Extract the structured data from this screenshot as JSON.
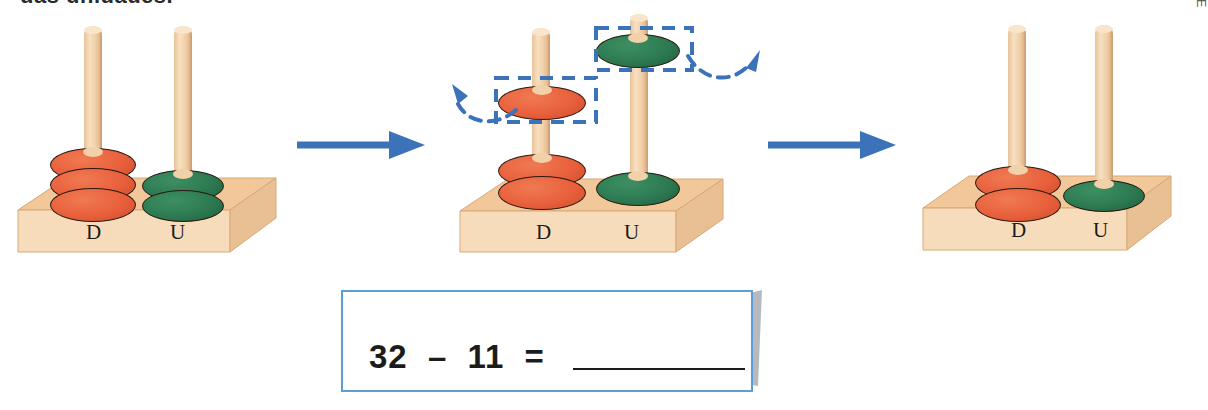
{
  "caption": {
    "cut_text": "das unidades."
  },
  "credit": {
    "text": "ILUSTRAÇÕES: EDITORIA DE ARTE"
  },
  "colors": {
    "disc_red": "#E8603C",
    "disc_green": "#2D7A52",
    "wood_top": "#F2C89A",
    "wood_front": "#F7DCBB",
    "peg": "#F0CFA0",
    "arrow_blue": "#3B72B8",
    "dash_blue": "#3B72B8",
    "box_border": "#5B9ED6",
    "outline": "#2A1A10"
  },
  "panels": [
    {
      "id": "step-1",
      "name": "abacus-start",
      "columns": [
        {
          "label": "D",
          "place": "dezenas",
          "color": "red",
          "count": 3
        },
        {
          "label": "U",
          "place": "unidades",
          "color": "green",
          "count": 2
        }
      ],
      "value": 32,
      "removed_red": 0,
      "removed_green": 0
    },
    {
      "id": "step-2",
      "name": "abacus-removing",
      "columns": [
        {
          "label": "D",
          "place": "dezenas",
          "color": "red",
          "count": 2
        },
        {
          "label": "U",
          "place": "unidades",
          "color": "green",
          "count": 1
        }
      ],
      "value": 21,
      "removed_red": 1,
      "removed_green": 1,
      "highlight_boxes": [
        {
          "name": "selection-box-red-disc",
          "target": "red-disc-lifted"
        },
        {
          "name": "selection-box-green-disc",
          "target": "green-disc-lifted"
        }
      ],
      "curved_arrows": [
        {
          "name": "curved-arrow-remove-red",
          "direction": "up-left"
        },
        {
          "name": "curved-arrow-remove-green",
          "direction": "up-right"
        }
      ]
    },
    {
      "id": "step-3",
      "name": "abacus-result",
      "columns": [
        {
          "label": "D",
          "place": "dezenas",
          "color": "red",
          "count": 2
        },
        {
          "label": "U",
          "place": "unidades",
          "color": "green",
          "count": 1
        }
      ],
      "value": 21,
      "removed_red": 0,
      "removed_green": 0
    }
  ],
  "transitions": [
    {
      "name": "arrow-step1-to-step2",
      "glyph": "→"
    },
    {
      "name": "arrow-step2-to-step3",
      "glyph": "→"
    }
  ],
  "equation": {
    "minuend": "32",
    "operator": "–",
    "subtrahend": "11",
    "equals": "=",
    "answer": "",
    "full_text": "32 – 11 = "
  }
}
